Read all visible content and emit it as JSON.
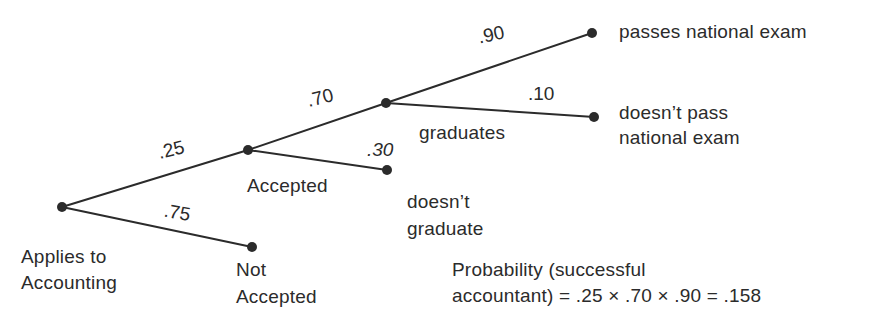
{
  "diagram": {
    "type": "probability-tree",
    "colors": {
      "line": "#2b2b2b",
      "node": "#2b2b2b",
      "background": "#ffffff"
    },
    "nodes": {
      "root": {
        "label_line1": "Applies to",
        "label_line2": "Accounting"
      },
      "accepted": {
        "label": "Accepted"
      },
      "not_accepted": {
        "label_line1": "Not",
        "label_line2": "Accepted"
      },
      "graduates": {
        "label": "graduates"
      },
      "doesnt_graduate": {
        "label_line1": "doesn’t",
        "label_line2": "graduate"
      },
      "passes": {
        "label": "passes national exam"
      },
      "doesnt_pass": {
        "label_line1": "doesn’t pass",
        "label_line2": "national exam"
      }
    },
    "edges": {
      "root_accepted": ".25",
      "root_not_accepted": ".75",
      "accepted_graduates": ".70",
      "accepted_doesnt_graduate": ".30",
      "graduates_passes": ".90",
      "graduates_doesnt_pass": ".10"
    },
    "formula": {
      "line1": "Probability (successful",
      "line2": "accountant) = .25 × .70 × .90 = .158"
    }
  }
}
